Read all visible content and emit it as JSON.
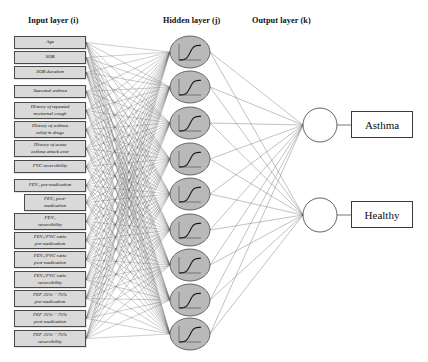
{
  "titles": {
    "input": "Input layer  (i)",
    "hidden": "Hidden layer  (j)",
    "output": "Output layer  (k)"
  },
  "colors": {
    "input_box_fill": "#d9d9d9",
    "input_box_stroke": "#4a4a4a",
    "hidden_node_fill": "#b9b9b9",
    "hidden_node_stroke": "#4a4a4a",
    "output_node_fill": "#ffffff",
    "output_node_stroke": "#3a3a3a",
    "edge": "#555555",
    "background": "#ffffff"
  },
  "input_layer": {
    "count": 16,
    "nodes": [
      {
        "label": "Age",
        "x": 14,
        "y": 36,
        "w": 72,
        "h": 13
      },
      {
        "label": "SOB",
        "x": 14,
        "y": 51,
        "w": 72,
        "h": 13
      },
      {
        "label": "SOB duration",
        "x": 14,
        "y": 66,
        "w": 72,
        "h": 13
      },
      {
        "label": "Seasonal asthma",
        "x": 14,
        "y": 85,
        "w": 72,
        "h": 13
      },
      {
        "label": "History of repeated\nnocturnal cough",
        "x": 14,
        "y": 102,
        "w": 72,
        "h": 17
      },
      {
        "label": "History of asthma\nrelief in drugs",
        "x": 14,
        "y": 121,
        "w": 72,
        "h": 17
      },
      {
        "label": "History of acute\nasthma attack ever",
        "x": 14,
        "y": 140,
        "w": 72,
        "h": 17
      },
      {
        "label": "FVC reversibility",
        "x": 14,
        "y": 160,
        "w": 72,
        "h": 13
      },
      {
        "label": "FEV₁ pre-medication",
        "x": 14,
        "y": 179,
        "w": 72,
        "h": 13
      },
      {
        "label": "FEV₁ post-\nmedication",
        "x": 24,
        "y": 194,
        "w": 62,
        "h": 17
      },
      {
        "label": "FEV₁\nreversibility",
        "x": 14,
        "y": 213,
        "w": 72,
        "h": 17
      },
      {
        "label": "FEV₁/FVC ratio\npre-medication",
        "x": 14,
        "y": 232,
        "w": 72,
        "h": 17
      },
      {
        "label": "FEV₁/FVC ratio\npost-medication",
        "x": 14,
        "y": 251,
        "w": 72,
        "h": 17
      },
      {
        "label": "FEV₁/FVC ratio\nreversibility",
        "x": 14,
        "y": 271,
        "w": 72,
        "h": 17
      },
      {
        "label": "FEF 25% ~ 75%\npre-medication",
        "x": 14,
        "y": 290,
        "w": 72,
        "h": 17
      },
      {
        "label": "FEF 25% ~ 75%\npost-medication",
        "x": 14,
        "y": 310,
        "w": 72,
        "h": 17
      },
      {
        "label": "FEF 25% ~ 75%\nreversibility",
        "x": 14,
        "y": 330,
        "w": 72,
        "h": 17
      }
    ]
  },
  "hidden_layer": {
    "count": 9,
    "node_icon": "sigmoid-curve-icon",
    "cx": 190,
    "rx": 20,
    "ry": 16,
    "cys": [
      52,
      87,
      123,
      159,
      194,
      230,
      265,
      300,
      334
    ]
  },
  "output_layer": {
    "count": 2,
    "cx": 320,
    "r": 17,
    "nodes": [
      {
        "label": "Asthma",
        "cy": 125,
        "box_x": 351,
        "box_y": 111,
        "box_w": 62,
        "box_h": 27
      },
      {
        "label": "Healthy",
        "cy": 215,
        "box_x": 351,
        "box_y": 201,
        "box_w": 62,
        "box_h": 27
      }
    ]
  },
  "caption": ""
}
